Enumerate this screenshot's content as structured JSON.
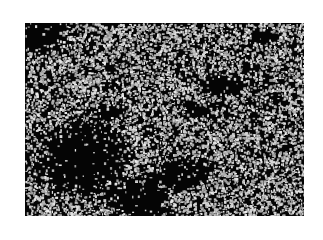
{
  "image": {
    "description": "Grayscale dark-field micrograph of densely packed bright cells with dark cell-free regions",
    "frame": {
      "x": 25,
      "y": 23,
      "width": 279,
      "height": 193
    },
    "colors": {
      "background": "#ffffff",
      "field": "#050505",
      "cells": "#c8c8c8"
    },
    "dark_regions": [
      {
        "cx": 0.06,
        "cy": 0.06,
        "rx": 0.1,
        "ry": 0.1
      },
      {
        "cx": 0.2,
        "cy": 0.7,
        "rx": 0.2,
        "ry": 0.22
      },
      {
        "cx": 0.4,
        "cy": 0.9,
        "rx": 0.14,
        "ry": 0.12
      },
      {
        "cx": 0.55,
        "cy": 0.78,
        "rx": 0.12,
        "ry": 0.1
      },
      {
        "cx": 0.7,
        "cy": 0.32,
        "rx": 0.1,
        "ry": 0.06
      },
      {
        "cx": 0.62,
        "cy": 0.45,
        "rx": 0.06,
        "ry": 0.05
      },
      {
        "cx": 0.3,
        "cy": 0.46,
        "rx": 0.07,
        "ry": 0.05
      },
      {
        "cx": 0.85,
        "cy": 0.06,
        "rx": 0.06,
        "ry": 0.04
      }
    ]
  }
}
